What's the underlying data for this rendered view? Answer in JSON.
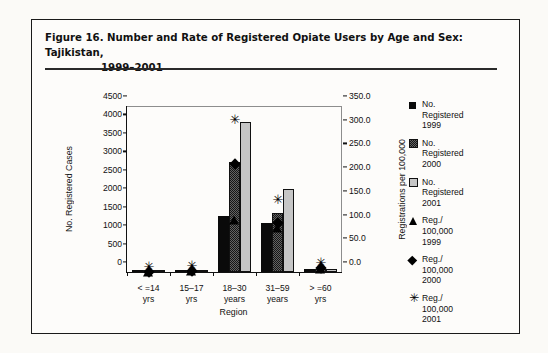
{
  "figure": {
    "title_line1": "Figure 16.  Number and Rate of Registered Opiate Users by Age and Sex: Tajikistan,",
    "title_line2": "1999–2001"
  },
  "chart_data": {
    "type": "bar",
    "title": "Number and Rate of Registered Opiate Users by Age and Sex: Tajikistan, 1999–2001",
    "xlabel": "Region",
    "ylabel": "No. Registered Cases",
    "y2label": "Registrations per 100,000",
    "ylim": [
      0,
      4500
    ],
    "y2lim": [
      0.0,
      350.0
    ],
    "grid": false,
    "legend_position": "right",
    "categories": [
      "< =14\nyrs",
      "15–17\nyrs",
      "18–30\nyears",
      "31–59\nyears",
      "> =60\nyrs"
    ],
    "category_labels": [
      {
        "line1": "< =14",
        "line2": "yrs"
      },
      {
        "line1": "15–17",
        "line2": "yrs"
      },
      {
        "line1": "18–30",
        "line2": "years"
      },
      {
        "line1": "31–59",
        "line2": "years"
      },
      {
        "line1": "> =60",
        "line2": "yrs"
      }
    ],
    "yticks": [
      "0",
      "500",
      "1000",
      "1500",
      "2000",
      "2500",
      "3000",
      "3500",
      "4000",
      "4500"
    ],
    "y2ticks": [
      "0.0",
      "50.0",
      "100.0",
      "150.0",
      "200.0",
      "250.0",
      "300.0",
      "350.0"
    ],
    "series": [
      {
        "name": "No. Registered 1999",
        "axis": "left",
        "marker": "square-solid",
        "values": [
          5,
          20,
          1520,
          1340,
          75
        ]
      },
      {
        "name": "No. Registered 2000",
        "axis": "left",
        "marker": "square-checked",
        "values": [
          8,
          35,
          2980,
          1590,
          80
        ]
      },
      {
        "name": "No. Registered 2001",
        "axis": "left",
        "marker": "square-dotted",
        "values": [
          10,
          45,
          4070,
          2240,
          75
        ]
      },
      {
        "name": "Reg./100,000 1999",
        "axis": "right",
        "marker": "triangle",
        "values": [
          0.5,
          2.0,
          110.0,
          92.0,
          6.0
        ]
      },
      {
        "name": "Reg./100,000 2000",
        "axis": "right",
        "marker": "diamond",
        "values": [
          1.0,
          3.0,
          228.0,
          103.0,
          8.0
        ]
      },
      {
        "name": "Reg./100,000 2001",
        "axis": "right",
        "marker": "asterisk",
        "values": [
          1.5,
          4.0,
          312.0,
          143.0,
          11.0
        ]
      }
    ]
  },
  "legend": {
    "items": [
      {
        "key": "square-solid",
        "text": "No.\nRegistered\n1999"
      },
      {
        "key": "square-checked",
        "text": "No.\nRegistered\n2000"
      },
      {
        "key": "square-dotted",
        "text": "No.\nRegistered\n2001"
      },
      {
        "key": "triangle",
        "text": "Reg./\n100,000\n1999"
      },
      {
        "key": "diamond",
        "text": "Reg./\n100,000\n2000"
      },
      {
        "key": "asterisk",
        "text": "Reg./\n100,000\n2001"
      }
    ]
  }
}
